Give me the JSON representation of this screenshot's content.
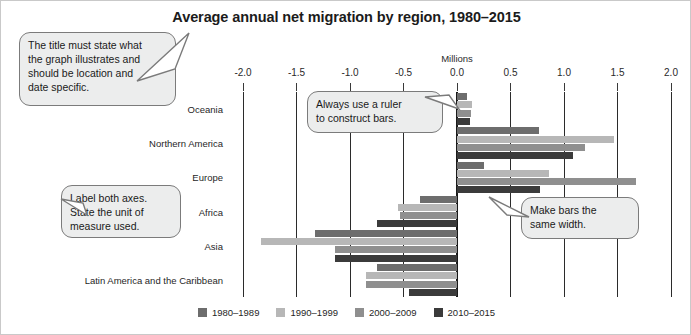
{
  "title": "Average annual net migration by region, 1980–2015",
  "unit_label": "Millions",
  "axis": {
    "ticks": [
      "-2.0",
      "-1.5",
      "-1.0",
      "-0.5",
      "0.0",
      "0.5",
      "1.0",
      "1.5",
      "2.0"
    ]
  },
  "legend": [
    {
      "label": "1980–1989",
      "color": "#6d6d6d"
    },
    {
      "label": "1990–1999",
      "color": "#b7b7b7"
    },
    {
      "label": "2000–2009",
      "color": "#8f8f8f"
    },
    {
      "label": "2010–2015",
      "color": "#3b3b3b"
    }
  ],
  "callouts": [
    {
      "name": "title-callout",
      "lines": [
        "The title must state what",
        "the graph illustrates and",
        "should be location and",
        "date specific."
      ]
    },
    {
      "name": "ruler-callout",
      "lines": [
        "Always use a ruler",
        "to construct bars."
      ]
    },
    {
      "name": "axes-callout",
      "lines": [
        "Label both axes.",
        "State the unit of",
        "measure used."
      ]
    },
    {
      "name": "width-callout",
      "lines": [
        "Make bars the",
        "same width."
      ]
    }
  ],
  "chart_data": {
    "type": "bar",
    "orientation": "horizontal",
    "title": "Average annual net migration by region, 1980–2015",
    "xlabel": "Millions",
    "ylabel": "",
    "xlim": [
      -2.0,
      2.0
    ],
    "xticks": [
      -2.0,
      -1.5,
      -1.0,
      -0.5,
      0.0,
      0.5,
      1.0,
      1.5,
      2.0
    ],
    "grid": true,
    "legend_position": "bottom",
    "categories": [
      "Oceania",
      "Northern America",
      "Europe",
      "Africa",
      "Asia",
      "Latin America and the Caribbean"
    ],
    "series": [
      {
        "name": "1980–1989",
        "color": "#6d6d6d",
        "values": [
          0.09,
          0.77,
          0.25,
          -0.35,
          -1.33,
          -0.75
        ]
      },
      {
        "name": "1990–1999",
        "color": "#b7b7b7",
        "values": [
          0.14,
          1.47,
          0.86,
          -0.55,
          -1.83,
          -0.85
        ]
      },
      {
        "name": "2000–2009",
        "color": "#8f8f8f",
        "values": [
          0.13,
          1.2,
          1.67,
          -0.53,
          -1.14,
          -0.85
        ]
      },
      {
        "name": "2010–2015",
        "color": "#3b3b3b",
        "values": [
          0.12,
          1.08,
          0.78,
          -0.75,
          -1.14,
          -0.45
        ]
      }
    ]
  }
}
